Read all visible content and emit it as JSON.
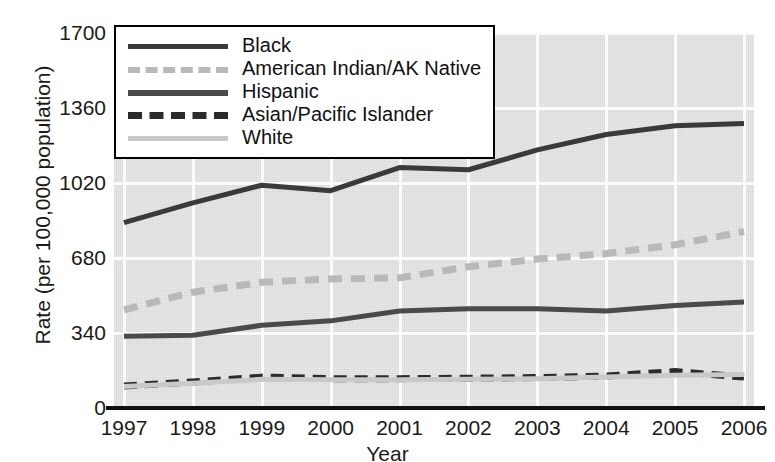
{
  "chart_data": {
    "type": "line",
    "title": "",
    "xlabel": "Year",
    "ylabel": "Rate (per 100,000 population)",
    "categories": [
      "1997",
      "1998",
      "1999",
      "2000",
      "2001",
      "2002",
      "2003",
      "2004",
      "2005",
      "2006"
    ],
    "x": [
      1997,
      1998,
      1999,
      2000,
      2001,
      2002,
      2003,
      2004,
      2005,
      2006
    ],
    "ylim": [
      0,
      1700
    ],
    "yticks": [
      0,
      340,
      680,
      1020,
      1360,
      1700
    ],
    "ytick_labels": [
      "0",
      "340",
      "680",
      "1020",
      "1360",
      "1700"
    ],
    "grid": true,
    "legend_position": "top-left",
    "series": [
      {
        "name": "Black",
        "color": "#3a3a3a",
        "style": "solid",
        "values": [
          840,
          930,
          1010,
          985,
          1090,
          1080,
          1170,
          1240,
          1280,
          1290
        ]
      },
      {
        "name": "American Indian/AK Native",
        "color": "#b9b9b9",
        "style": "dashed",
        "values": [
          445,
          525,
          570,
          585,
          590,
          640,
          675,
          700,
          740,
          800
        ]
      },
      {
        "name": "Hispanic",
        "color": "#4a4a4a",
        "style": "solid",
        "values": [
          325,
          330,
          375,
          395,
          440,
          450,
          450,
          440,
          465,
          480
        ]
      },
      {
        "name": "Asian/Pacific Islander",
        "color": "#2b2b2b",
        "style": "dashed",
        "values": [
          100,
          118,
          140,
          133,
          133,
          135,
          138,
          145,
          165,
          140
        ]
      },
      {
        "name": "White",
        "color": "#c9c9c9",
        "style": "solid",
        "values": [
          97,
          112,
          130,
          128,
          128,
          130,
          133,
          140,
          148,
          152
        ]
      }
    ]
  },
  "legend": {
    "items": [
      {
        "label": "Black"
      },
      {
        "label": "American Indian/AK Native"
      },
      {
        "label": "Hispanic"
      },
      {
        "label": "Asian/Pacific Islander"
      },
      {
        "label": "White"
      }
    ]
  }
}
